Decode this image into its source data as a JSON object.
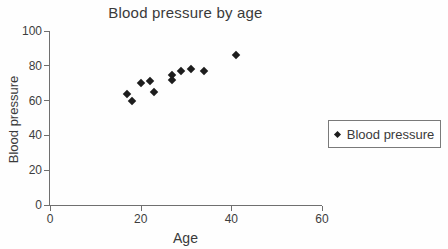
{
  "chart_data": {
    "type": "scatter",
    "title": "Blood pressure by age",
    "xlabel": "Age",
    "ylabel": "Blood pressure",
    "xlim": [
      0,
      60
    ],
    "ylim": [
      0,
      100
    ],
    "x_ticks": [
      0,
      20,
      40,
      60
    ],
    "y_ticks": [
      0,
      20,
      40,
      60,
      80,
      100
    ],
    "grid": false,
    "legend_position": "right-outside",
    "series": [
      {
        "name": "Blood pressure",
        "marker": "diamond",
        "color": "#1d1d1d",
        "points": [
          {
            "x": 17,
            "y": 64
          },
          {
            "x": 18,
            "y": 60
          },
          {
            "x": 20,
            "y": 70
          },
          {
            "x": 22,
            "y": 71
          },
          {
            "x": 23,
            "y": 65
          },
          {
            "x": 27,
            "y": 75
          },
          {
            "x": 27,
            "y": 72
          },
          {
            "x": 29,
            "y": 77
          },
          {
            "x": 31,
            "y": 78
          },
          {
            "x": 34,
            "y": 77
          },
          {
            "x": 41,
            "y": 86
          }
        ]
      }
    ],
    "legend": {
      "label": "Blood pressure"
    }
  },
  "colors": {
    "text": "#3a3a3a",
    "axis": "#6f6f6f",
    "marker": "#1d1d1d",
    "background": "#fefefe",
    "legend_border": "#7a7a7a"
  }
}
